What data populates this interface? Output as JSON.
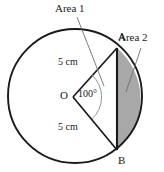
{
  "diagram": {
    "background_color": "#ffffff",
    "stroke_color": "#1a1a1a",
    "shaded_fill_color": "#a8a8a8",
    "labels": {
      "area1": "Area 1",
      "area2": "Area 2",
      "point_a": "A",
      "point_b": "B",
      "center": "O",
      "angle": "100°",
      "radius_upper": "5 cm",
      "radius_lower": "5 cm"
    },
    "geometry": {
      "circle_center_x": 75,
      "circle_center_y": 96,
      "circle_radius": 67,
      "point_a_x": 117,
      "point_a_y": 48,
      "point_b_x": 117,
      "point_b_y": 150,
      "vertex_o_x": 73,
      "vertex_o_y": 97,
      "central_angle_degrees": 100,
      "radius_length_cm": 5
    }
  }
}
